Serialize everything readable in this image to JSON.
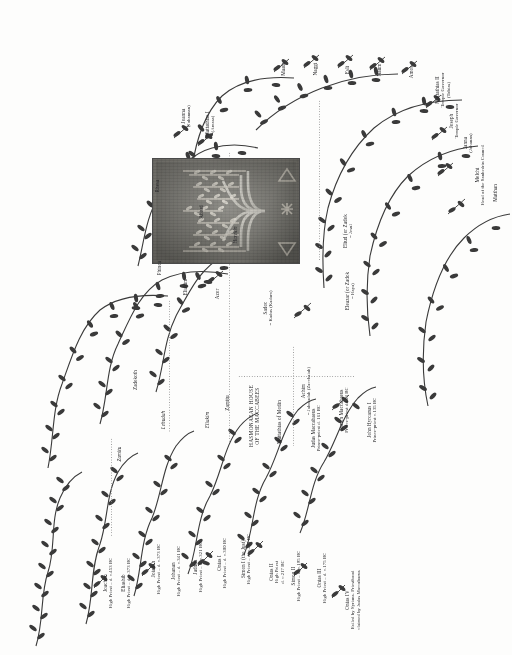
{
  "document": {
    "title": "Genealogical tree of the High Priests and the Hasmonaean House",
    "orientation": "labels rotated 90 degrees counter-clockwise",
    "background_color": "#fdfdfc",
    "ink_color": "#29292b"
  },
  "plate": {
    "name": "menorah-engraving",
    "caption": "",
    "frame_color": "#4a4a4a",
    "base_color": "#8e8d86"
  },
  "sections": {
    "hasmonaean_heading_line1": "HASMONAEAN HOUSE",
    "hasmonaean_heading_line2": "OF THE MACCABEES"
  },
  "nodes": [
    {
      "id": "joachim",
      "name": "Joachim",
      "sub": "High Priest – d. c.453 BC"
    },
    {
      "id": "eliashib",
      "name": "Eliashib",
      "sub": "High Priest – d. c.373 BC"
    },
    {
      "id": "joiadah",
      "name": "Joiadah",
      "sub": "High Priest – d. c.373 BC"
    },
    {
      "id": "johanan",
      "name": "Johanan",
      "sub": "High Priest – d. c.341 BC"
    },
    {
      "id": "jaddua",
      "name": "Jaddua",
      "sub": "High Priest – d. c.321 BC"
    },
    {
      "id": "onias-i",
      "name": "Onias I",
      "sub": "High Priest – d. c.300 BC"
    },
    {
      "id": "simon-i",
      "name": "Simon I (the Just)",
      "sub": "High Priest – d. c.291 BC"
    },
    {
      "id": "onias-ii",
      "name": "Onias II",
      "sub": "High Priest",
      "sub2": "d. c.217 BC"
    },
    {
      "id": "simon-ii",
      "name": "Simon II",
      "sub": "High Priest – d. c.195 BC"
    },
    {
      "id": "onias-iii",
      "name": "Onias III",
      "sub": "High Priest – d. c.175 BC"
    },
    {
      "id": "onias-iv",
      "name": "Onias IV",
      "sub": "Exiled by Syrians. Priesthood",
      "sub2": "claimed by Judas Maccabaeus"
    },
    {
      "id": "mattathias-modin",
      "name": "Mattathias of Modin",
      "sub": ""
    },
    {
      "id": "judas-mac",
      "name": "Judas Maccabaeus",
      "sub": "Prince-priest d. 161 BC"
    },
    {
      "id": "simon-mac",
      "name": "Simon Maccabaeus",
      "sub": "Prince-priest d.143 BC"
    },
    {
      "id": "john-hyrcanus",
      "name": "John Hyrcanus I",
      "sub": "Prince-priest c.135 BC"
    },
    {
      "id": "achim",
      "name": "Achim",
      "sub": "= Jahoiadah (Zacchaiah)",
      "italic_sub": true
    },
    {
      "id": "eliud-zadok",
      "name": "Eliud (or Zadok",
      "sub": "= Jesul",
      "italic_sub": true
    },
    {
      "id": "eleazar-zadok",
      "name": "Eleazar (or Zadok",
      "sub": "= Haya)",
      "italic_sub": true
    },
    {
      "id": "sadoc",
      "name": "Sadoc",
      "sub": "= Kadus (Kadam)",
      "italic_sub": true
    },
    {
      "id": "azhim",
      "name": "Azhim",
      "sub": "= Azhmí (Zazhadi)",
      "italic_sub": true
    },
    {
      "id": "nefnah",
      "name": "Nefnah",
      "sub": "",
      "italic": true
    },
    {
      "id": "eliakim",
      "name": "Eliakim",
      "sub": ""
    },
    {
      "id": "azor",
      "name": "Azor",
      "sub": ""
    },
    {
      "id": "lehudah",
      "name": "Lehudah",
      "sub": "",
      "italic": true
    },
    {
      "id": "zadekoth",
      "name": "Zadekoth",
      "sub": ""
    },
    {
      "id": "zamiiu",
      "name": "Zamitu",
      "sub": "",
      "italic": true
    },
    {
      "id": "phinca",
      "name": "Phinca",
      "sub": ""
    },
    {
      "id": "abiud",
      "name": "Abiud",
      "sub": ""
    },
    {
      "id": "rhesa",
      "name": "Rhesa",
      "sub": ""
    },
    {
      "id": "joanna",
      "name": "Joanna",
      "sub": "(Johannan)"
    },
    {
      "id": "mattathias-i",
      "name": "Mattathias I",
      "sub": "(Amasa)"
    },
    {
      "id": "hezekin",
      "name": "Hezekin",
      "sub": "",
      "italic": true
    },
    {
      "id": "maath",
      "name": "Maath",
      "sub": ""
    },
    {
      "id": "naggi",
      "name": "Naggi",
      "sub": ""
    },
    {
      "id": "esli",
      "name": "Esli",
      "sub": ""
    },
    {
      "id": "naum",
      "name": "Naum",
      "sub": ""
    },
    {
      "id": "amos",
      "name": "Amos",
      "sub": ""
    },
    {
      "id": "mattathias-ii",
      "name": "Mattathias II",
      "sub": "Temple Governor",
      "sub2": "(Tobias)"
    },
    {
      "id": "joseph",
      "name": "Joseph",
      "sub": "Temple Governor"
    },
    {
      "id": "janna",
      "name": "Janna",
      "sub": "(Johanan)"
    },
    {
      "id": "melchi",
      "name": "Melchi",
      "sub": "Head of the Sanhedrin Council"
    },
    {
      "id": "matthan",
      "name": "Matthan",
      "sub": ""
    }
  ]
}
